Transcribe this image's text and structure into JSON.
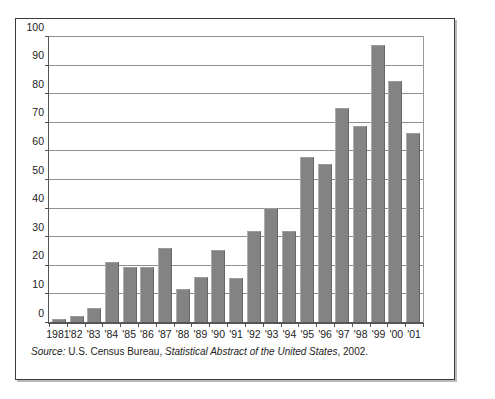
{
  "figure": {
    "source_prefix": "Source:",
    "source_agency": "U.S. Census Bureau,",
    "source_title": "Statistical Abstract of the United States",
    "source_year": ", 2002."
  },
  "style": {
    "bar_color": "#838383",
    "grid_color": "#8e8f92",
    "axis_color": "#55565a",
    "text_color": "#1c1c1c",
    "frame_color": "#3a3a3a",
    "background": "#ffffff"
  },
  "chart_data": {
    "type": "bar",
    "title": "",
    "subtitle": "",
    "xlabel": "",
    "ylabel": "",
    "ylim": [
      0,
      100
    ],
    "yticks": [
      0,
      10,
      20,
      30,
      40,
      50,
      60,
      70,
      80,
      90,
      100
    ],
    "ytick_labels": [
      "0",
      "10",
      "20",
      "30",
      "40",
      "50",
      "60",
      "70",
      "80",
      "90",
      "100"
    ],
    "grid": true,
    "grid_axis": "y",
    "legend": false,
    "legend_position": "none",
    "categories": [
      "1981",
      "'82",
      "'83",
      "'84",
      "'85",
      "'86",
      "'87",
      "'88",
      "'89",
      "'90",
      "'91",
      "'92",
      "'93",
      "'94",
      "'95",
      "'96",
      "'97",
      "'98",
      "'99",
      "'00",
      "'01"
    ],
    "values": [
      1,
      2,
      5,
      21,
      19.5,
      19.5,
      26,
      11.5,
      16,
      25.5,
      15.5,
      32,
      40,
      32,
      58,
      55.5,
      75.5,
      69,
      97.5,
      85,
      66.5
    ],
    "annotations": []
  }
}
